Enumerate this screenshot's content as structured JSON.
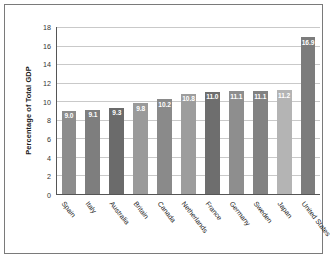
{
  "chart_data": {
    "type": "bar",
    "title": "",
    "xlabel": "",
    "ylabel": "Percentage of Total GDP",
    "ylim": [
      0,
      18
    ],
    "ytick_step": 2,
    "yticks": [
      "18",
      "16",
      "14",
      "12",
      "10",
      "8",
      "6",
      "4",
      "2",
      "0"
    ],
    "grid": "horizontal",
    "legend": "none",
    "categories": [
      "Spain",
      "Italy",
      "Australia",
      "Britain",
      "Canada",
      "Netherlands",
      "France",
      "Germany",
      "Sweden",
      "Japan",
      "United States"
    ],
    "values": [
      9.0,
      9.1,
      9.3,
      9.8,
      10.2,
      10.8,
      11.0,
      11.1,
      11.1,
      11.2,
      16.9
    ],
    "value_labels": [
      "9.0",
      "9.1",
      "9.3",
      "9.8",
      "10.2",
      "10.8",
      "11.0",
      "11.1",
      "11.1",
      "11.2",
      "16.9"
    ],
    "bar_colors": [
      "#8c8c8c",
      "#7e7e7e",
      "#6b6b6b",
      "#9a9a9a",
      "#8a8a8a",
      "#9d9d9d",
      "#6e6e6e",
      "#8e8e8e",
      "#828282",
      "#b4b4b4",
      "#7c7c7c"
    ],
    "value_label_color": "#ffffff",
    "axis_color": "#555555",
    "grid_color": "#c9c9c9",
    "frame_color": "#7a7a7a",
    "background": "#ffffff"
  }
}
